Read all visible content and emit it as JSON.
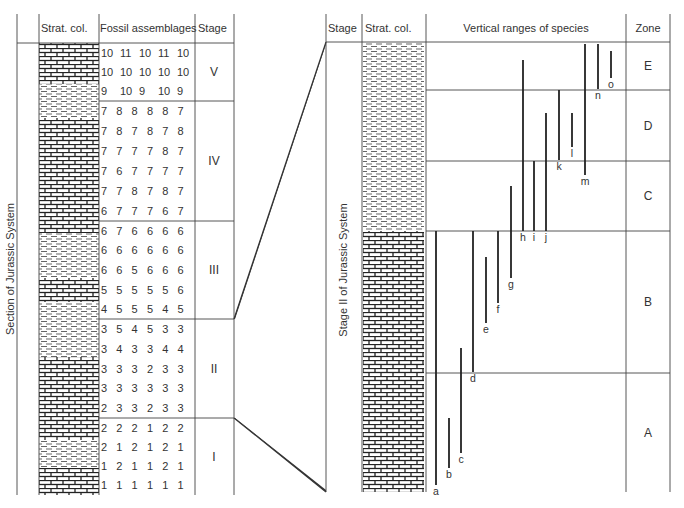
{
  "left_panel": {
    "headers": {
      "strat_col": "Strat. col.",
      "fossils": "Fossil assemblages",
      "stage": "Stage"
    },
    "side_label": "Section of Jurassic System",
    "stages": [
      {
        "name": "V",
        "top": 43,
        "bottom": 101,
        "rows": [
          [
            "10",
            "11",
            "10",
            "11",
            "10"
          ],
          [
            "10",
            "10",
            "10",
            "10",
            "10"
          ],
          [
            "9",
            "10",
            "9",
            "10",
            "9"
          ]
        ]
      },
      {
        "name": "IV",
        "top": 101,
        "bottom": 221,
        "rows": [
          [
            "7",
            "8",
            "8",
            "8",
            "8",
            "7"
          ],
          [
            "7",
            "8",
            "7",
            "8",
            "7",
            "8"
          ],
          [
            "7",
            "7",
            "7",
            "7",
            "8",
            "7"
          ],
          [
            "7",
            "6",
            "7",
            "7",
            "7",
            "7"
          ],
          [
            "7",
            "7",
            "8",
            "7",
            "8",
            "7"
          ],
          [
            "6",
            "7",
            "7",
            "7",
            "6",
            "7"
          ]
        ]
      },
      {
        "name": "III",
        "top": 221,
        "bottom": 319,
        "rows": [
          [
            "6",
            "7",
            "6",
            "6",
            "6",
            "6"
          ],
          [
            "6",
            "6",
            "6",
            "6",
            "6",
            "6"
          ],
          [
            "6",
            "6",
            "5",
            "6",
            "6",
            "6"
          ],
          [
            "5",
            "5",
            "5",
            "5",
            "5",
            "6"
          ],
          [
            "4",
            "5",
            "5",
            "5",
            "4",
            "5"
          ]
        ]
      },
      {
        "name": "II",
        "top": 319,
        "bottom": 418,
        "rows": [
          [
            "3",
            "5",
            "4",
            "5",
            "3",
            "3"
          ],
          [
            "3",
            "4",
            "3",
            "3",
            "4",
            "4"
          ],
          [
            "3",
            "3",
            "3",
            "2",
            "3",
            "3"
          ],
          [
            "3",
            "3",
            "3",
            "3",
            "3",
            "3"
          ],
          [
            "2",
            "3",
            "3",
            "2",
            "3",
            "3"
          ]
        ]
      },
      {
        "name": "I",
        "top": 418,
        "bottom": 495,
        "rows": [
          [
            "2",
            "2",
            "2",
            "1",
            "2",
            "2"
          ],
          [
            "2",
            "1",
            "2",
            "1",
            "2",
            "1"
          ],
          [
            "1",
            "2",
            "1",
            "1",
            "2",
            "1"
          ],
          [
            "1",
            "1",
            "1",
            "1",
            "1",
            "1"
          ]
        ]
      }
    ],
    "lithology": [
      {
        "type": "limestone",
        "top": 43,
        "bottom": 84
      },
      {
        "type": "shale",
        "top": 84,
        "bottom": 118
      },
      {
        "type": "limestone",
        "top": 118,
        "bottom": 233
      },
      {
        "type": "shale",
        "top": 233,
        "bottom": 278
      },
      {
        "type": "limestone",
        "top": 278,
        "bottom": 302
      },
      {
        "type": "shale",
        "top": 302,
        "bottom": 357
      },
      {
        "type": "limestone",
        "top": 357,
        "bottom": 440
      },
      {
        "type": "shale",
        "top": 440,
        "bottom": 468
      },
      {
        "type": "limestone",
        "top": 468,
        "bottom": 495
      }
    ]
  },
  "right_panel": {
    "headers": {
      "stage": "Stage",
      "strat_col": "Strat. col.",
      "ranges": "Vertical ranges of species",
      "zone": "Zone"
    },
    "side_label": "Stage II of Jurassic System",
    "zones": [
      {
        "name": "E",
        "top": 42,
        "bottom": 90
      },
      {
        "name": "D",
        "top": 90,
        "bottom": 161
      },
      {
        "name": "C",
        "top": 161,
        "bottom": 231
      },
      {
        "name": "B",
        "top": 231,
        "bottom": 373
      },
      {
        "name": "A",
        "top": 373,
        "bottom": 492
      }
    ],
    "lithology": [
      {
        "type": "shale",
        "top": 42,
        "bottom": 231
      },
      {
        "type": "limestone",
        "top": 231,
        "bottom": 492
      }
    ],
    "species": [
      {
        "label": "a",
        "x": 436,
        "top": 231,
        "bottom": 485
      },
      {
        "label": "b",
        "x": 449,
        "top": 418,
        "bottom": 468
      },
      {
        "label": "c",
        "x": 461,
        "top": 348,
        "bottom": 453
      },
      {
        "label": "d",
        "x": 473,
        "top": 231,
        "bottom": 372
      },
      {
        "label": "e",
        "x": 486,
        "top": 257,
        "bottom": 323
      },
      {
        "label": "f",
        "x": 498,
        "top": 231,
        "bottom": 303
      },
      {
        "label": "g",
        "x": 511,
        "top": 186,
        "bottom": 278
      },
      {
        "label": "h",
        "x": 523,
        "top": 60,
        "bottom": 231
      },
      {
        "label": "i",
        "x": 534,
        "top": 161,
        "bottom": 231
      },
      {
        "label": "j",
        "x": 546,
        "top": 113,
        "bottom": 231
      },
      {
        "label": "k",
        "x": 559,
        "top": 90,
        "bottom": 160
      },
      {
        "label": "l",
        "x": 572,
        "top": 113,
        "bottom": 147
      },
      {
        "label": "m",
        "x": 585,
        "top": 44,
        "bottom": 175
      },
      {
        "label": "n",
        "x": 598,
        "top": 44,
        "bottom": 89
      },
      {
        "label": "o",
        "x": 611,
        "top": 51,
        "bottom": 78
      }
    ]
  },
  "connector": {
    "from_top": 319,
    "from_bottom": 418,
    "to_top": 42,
    "to_bottom": 492
  }
}
